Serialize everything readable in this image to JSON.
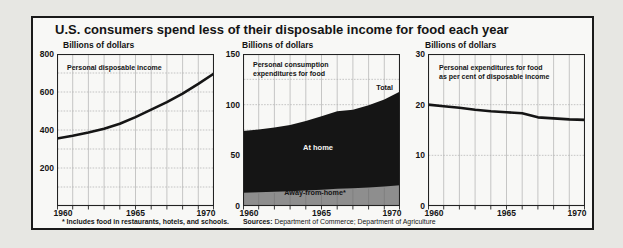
{
  "title": "U.S. consumers spend less of their disposable income for food each year",
  "footnote": "* Includes food in restaurants, hotels, and schools.",
  "sources_label": "Sources:",
  "sources_text": "Department of Commerce; Department of Agriculture",
  "colors": {
    "ink": "#151515",
    "grid": "#b0b0b0",
    "band_gray": "#8e8e8e",
    "band_gridline": "#787878",
    "frame_bg": "#f8f8f6",
    "page_bg": "#e7e7e3"
  },
  "chart_data": [
    {
      "type": "line",
      "unit_label": "Billions of dollars",
      "inner_label": "Personal disposable income",
      "years": [
        1960,
        1961,
        1962,
        1963,
        1964,
        1965,
        1966,
        1967,
        1968,
        1969,
        1970
      ],
      "values": [
        355,
        370,
        387,
        407,
        433,
        468,
        507,
        547,
        592,
        643,
        697
      ],
      "ylim": [
        0,
        800
      ],
      "yticks": [
        800,
        600,
        400,
        200
      ],
      "grid_step": 100,
      "xtick_labels": [
        "1960",
        "1965",
        "1970"
      ],
      "xtick_indices": [
        0,
        5,
        10
      ]
    },
    {
      "type": "area",
      "unit_label": "Billions of dollars",
      "inner_label_line1": "Personal consumption",
      "inner_label_line2": "expenditures for food",
      "years": [
        1960,
        1961,
        1962,
        1963,
        1964,
        1965,
        1966,
        1967,
        1968,
        1969,
        1970
      ],
      "series": [
        {
          "name": "Total",
          "values": [
            74,
            75.5,
            77.5,
            80,
            84,
            88.5,
            93.5,
            95,
            99.5,
            105,
            113
          ]
        },
        {
          "name": "Away-from-home",
          "values": [
            13,
            13.5,
            14,
            14.6,
            15.3,
            16,
            17,
            17.6,
            18.3,
            19.2,
            20.5
          ]
        }
      ],
      "total_label": "Total",
      "at_home_label": "At home",
      "away_label": "Away-from-home*",
      "ylim": [
        0,
        150
      ],
      "yticks": [
        150,
        100,
        50,
        0
      ],
      "grid_step": 25,
      "xtick_labels": [
        "1960",
        "1965",
        "1970"
      ],
      "xtick_indices": [
        0,
        5,
        10
      ]
    },
    {
      "type": "line",
      "unit_label": "Billions of dollars",
      "inner_label_line1": "Personal expenditures for food",
      "inner_label_line2": "as per cent of disposable income",
      "years": [
        1960,
        1961,
        1962,
        1963,
        1964,
        1965,
        1966,
        1967,
        1968,
        1969,
        1970
      ],
      "values": [
        20,
        19.7,
        19.4,
        19.0,
        18.7,
        18.5,
        18.3,
        17.5,
        17.3,
        17.1,
        17.0
      ],
      "ylim": [
        0,
        30
      ],
      "yticks": [
        30,
        20,
        10,
        0
      ],
      "grid_step": 10,
      "xtick_labels": [
        "1960",
        "1965",
        "1970"
      ],
      "xtick_indices": [
        0,
        5,
        10
      ]
    }
  ]
}
